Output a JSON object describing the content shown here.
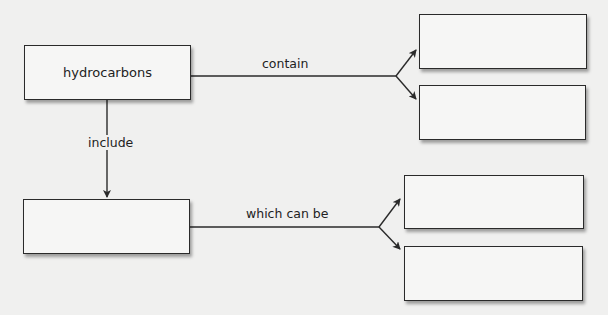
{
  "diagram": {
    "type": "concept-map",
    "nodes": [
      {
        "id": "hydrocarbons",
        "label": "hydrocarbons"
      },
      {
        "id": "included-type",
        "label": ""
      },
      {
        "id": "contain-1",
        "label": ""
      },
      {
        "id": "contain-2",
        "label": ""
      },
      {
        "id": "which-can-be-1",
        "label": ""
      },
      {
        "id": "which-can-be-2",
        "label": ""
      }
    ],
    "edges": [
      {
        "from": "hydrocarbons",
        "to": [
          "contain-1",
          "contain-2"
        ],
        "label": "contain"
      },
      {
        "from": "hydrocarbons",
        "to": [
          "included-type"
        ],
        "label": "include"
      },
      {
        "from": "included-type",
        "to": [
          "which-can-be-1",
          "which-can-be-2"
        ],
        "label": "which can be"
      }
    ]
  },
  "colors": {
    "background": "#f0f0ef",
    "box_fill": "#f6f6f5",
    "line": "#2a2a2a"
  }
}
